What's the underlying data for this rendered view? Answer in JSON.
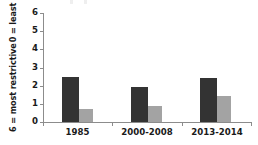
{
  "chart_data": {
    "type": "bar",
    "title": "",
    "subtitle": "",
    "xlabel": "",
    "ylabel": "6 = most restrictive  /  0 = least restrictive",
    "ylabel_lines": [
      "6 = most restrictive",
      "0 = least restrictive"
    ],
    "categories": [
      "1985",
      "2000-2008",
      "2013-2014"
    ],
    "series": [
      {
        "name": "series-dark",
        "color": "#333333",
        "values": [
          2.5,
          1.95,
          2.45
        ]
      },
      {
        "name": "series-light",
        "color": "#a3a3a3",
        "values": [
          0.7,
          0.9,
          1.45
        ]
      }
    ],
    "ylim": [
      0,
      6
    ],
    "yticks": [
      "0",
      "1",
      "2",
      "3",
      "4",
      "5",
      "6"
    ],
    "grid": false,
    "legend": "none",
    "axis_color": "#8c8c8c"
  },
  "axis": {
    "y_ticks": [
      "6",
      "5",
      "4",
      "3",
      "2",
      "1",
      "0"
    ]
  },
  "labels": {
    "y_caption_top": "6 = most restrictive",
    "y_caption_bottom": "0 = least restrictive",
    "x_0": "1985",
    "x_1": "2000-2008",
    "x_2": "2013-2014"
  }
}
